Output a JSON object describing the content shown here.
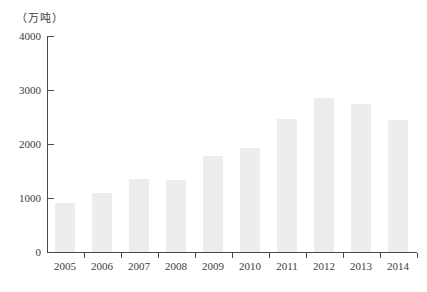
{
  "chart_data": {
    "type": "bar",
    "title": "",
    "ylabel": "（万吨）",
    "xlabel": "",
    "categories": [
      "2005",
      "2006",
      "2007",
      "2008",
      "2009",
      "2010",
      "2011",
      "2012",
      "2013",
      "2014"
    ],
    "values": [
      900,
      1100,
      1360,
      1340,
      1780,
      1930,
      2470,
      2850,
      2750,
      2440
    ],
    "yticks": [
      0,
      1000,
      2000,
      3000,
      4000
    ],
    "ylim": [
      0,
      4000
    ],
    "grid": "off",
    "legend": "none",
    "bar_color": "#ededed",
    "axis_color": "#4a4a4a",
    "text_color": "#3c3c3c"
  }
}
